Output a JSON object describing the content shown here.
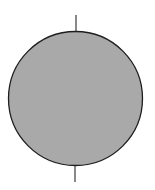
{
  "diagram": {
    "canvas": {
      "width": 155,
      "height": 190,
      "background": "#ffffff"
    },
    "sphere": {
      "cx": 75.5,
      "cy": 98.5,
      "r": 67,
      "fill": "#a9a9a9",
      "stroke": "#1e1e1e",
      "stroke_width": 1.3
    },
    "axis_top": {
      "x": 76,
      "y1": 15,
      "y2": 31,
      "color": "#3a3a3a",
      "width": 1.2
    },
    "axis_bottom": {
      "x": 75,
      "y1": 166,
      "y2": 182,
      "color": "#3a3a3a",
      "width": 1.2
    }
  }
}
